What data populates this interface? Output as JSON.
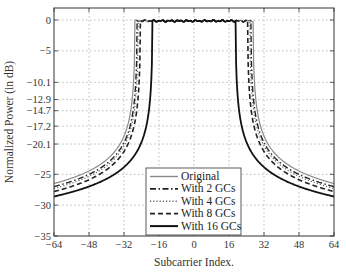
{
  "chart_data": {
    "type": "line",
    "title": "",
    "xlabel": "Subcarrier Index.",
    "ylabel": "Normalized Power (in dB)",
    "xlim": [
      -64,
      64
    ],
    "ylim": [
      -35,
      0
    ],
    "x_ticks": [
      -64,
      -48,
      -32,
      -16,
      0,
      16,
      32,
      48,
      64
    ],
    "x_tick_labels": [
      "−64",
      "−48",
      "−32",
      "−16",
      "0",
      "16",
      "32",
      "48",
      "64"
    ],
    "y_ticks": [
      0,
      -5,
      -10.1,
      -12.9,
      -14.7,
      -17.2,
      -20.1,
      -25,
      -30,
      -35
    ],
    "y_tick_labels": [
      "0",
      "−5",
      "−10.1",
      "−12.9",
      "−14.7",
      "−17.2",
      "−20.1",
      "−25",
      "−30",
      "−35"
    ],
    "grid": true,
    "legend_position": "lower center",
    "series": [
      {
        "name": "Original",
        "style": "solid-thin",
        "color": "#8a8a8a",
        "edge": 27,
        "tail": -26.5
      },
      {
        "name": "With 2 GCs",
        "style": "dash-dot",
        "color": "#222222",
        "edge": 26,
        "tail": -27.0
      },
      {
        "name": "With 4 GCs",
        "style": "dotted",
        "color": "#666666",
        "edge": 25.5,
        "tail": -27.3
      },
      {
        "name": "With 8 GCs",
        "style": "dashed",
        "color": "#222222",
        "edge": 24.5,
        "tail": -27.8
      },
      {
        "name": "With 16 GCs",
        "style": "solid-thick",
        "color": "#111111",
        "edge": 19,
        "tail": -28.6
      }
    ]
  }
}
